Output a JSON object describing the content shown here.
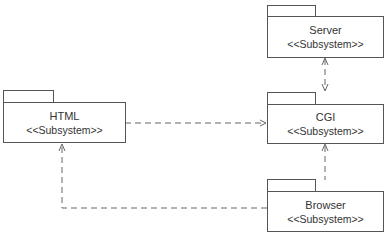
{
  "diagram": {
    "type": "UML package diagram",
    "packages": [
      {
        "id": "server",
        "name": "Server",
        "stereotype": "<<Subsystem>>"
      },
      {
        "id": "html",
        "name": "HTML",
        "stereotype": "<<Subsystem>>"
      },
      {
        "id": "cgi",
        "name": "CGI",
        "stereotype": "<<Subsystem>>"
      },
      {
        "id": "browser",
        "name": "Browser",
        "stereotype": "<<Subsystem>>"
      }
    ],
    "dependencies": [
      {
        "from": "html",
        "to": "cgi",
        "style": "dashed",
        "arrow": "open"
      },
      {
        "from": "server",
        "to": "cgi",
        "style": "dashed",
        "arrow": "both"
      },
      {
        "from": "browser",
        "to": "cgi",
        "style": "dashed",
        "arrow": "open"
      },
      {
        "from": "browser",
        "to": "html",
        "style": "dashed",
        "arrow": "open"
      }
    ],
    "colors": {
      "line": "#555555",
      "text": "#333333",
      "background": "#ffffff"
    }
  }
}
